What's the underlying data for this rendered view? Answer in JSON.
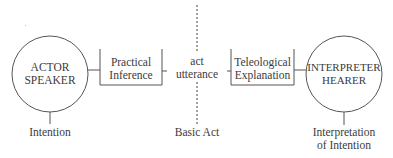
{
  "diagram": {
    "left_node": {
      "line1": "ACTOR",
      "line2": "SPEAKER"
    },
    "left_process": {
      "line1": "Practical",
      "line2": "Inference"
    },
    "center": {
      "line1": "act",
      "line2": "utterance"
    },
    "right_process": {
      "line1": "Teleological",
      "line2": "Explanation"
    },
    "right_node": {
      "line1": "INTERPRETER",
      "line2": "HEARER"
    },
    "bottom_labels": {
      "left": "Intention",
      "center": "Basic Act",
      "right_line1": "Interpretation",
      "right_line2": "of Intention"
    },
    "colors": {
      "stroke": "#4a4a4a",
      "text": "#3b3b3b",
      "background": "#ffffff"
    }
  }
}
